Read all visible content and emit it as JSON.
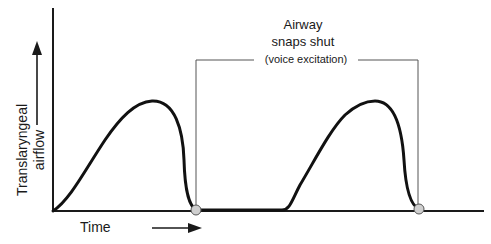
{
  "diagram": {
    "y_label_line1": "Translaryngeal",
    "y_label_line2": "airflow",
    "x_label": "Time",
    "annotation_line1": "Airway",
    "annotation_line2": "snaps shut",
    "annotation_line3": "(voice excitation)",
    "colors": {
      "curve": "#111111",
      "axis": "#1a1a1a",
      "bracket": "#555555",
      "marker_fill": "#cfcfcf",
      "marker_stroke": "#555555"
    }
  }
}
